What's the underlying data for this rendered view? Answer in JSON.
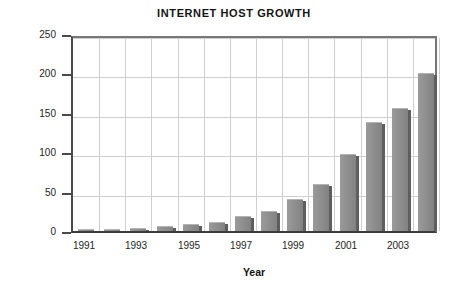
{
  "chart_data": {
    "type": "bar",
    "title": "INTERNET HOST GROWTH",
    "xlabel": "Year",
    "ylabel": "Growth (in millions)",
    "categories": [
      "1991",
      "1992",
      "1993",
      "1994",
      "1995",
      "1996",
      "1997",
      "1998",
      "1999",
      "2000",
      "2001",
      "2002",
      "2003",
      "2004"
    ],
    "values": [
      3,
      3,
      4,
      6,
      9,
      12,
      19,
      26,
      40,
      60,
      98,
      138,
      156,
      201
    ],
    "xtick_labels": [
      "1991",
      "1993",
      "1995",
      "1997",
      "1999",
      "2001",
      "2003"
    ],
    "xtick_indices": [
      0,
      2,
      4,
      6,
      8,
      10,
      12
    ],
    "ytick_labels": [
      "0",
      "50",
      "100",
      "150",
      "200",
      "250"
    ],
    "ytick_values": [
      0,
      50,
      100,
      150,
      200,
      250
    ],
    "ylim": [
      0,
      250
    ],
    "grid": true,
    "legend": null,
    "series": [
      {
        "name": "Internet hosts",
        "values": [
          3,
          3,
          4,
          6,
          9,
          12,
          19,
          26,
          40,
          60,
          98,
          138,
          156,
          201
        ]
      }
    ],
    "colors": {
      "bar_face": "#8d8d8d",
      "bar_shadow": "#5e5e5e",
      "bar_highlight": "#b4b4b4",
      "gridline": "#cfcfcf",
      "axis": "#4a4a4a",
      "text": "#141414",
      "background": "#ffffff"
    }
  }
}
